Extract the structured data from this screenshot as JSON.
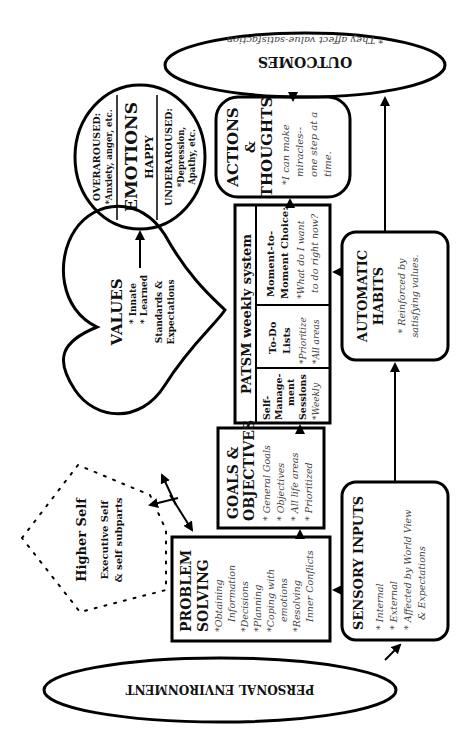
{
  "outcomes": {
    "title": "OUTCOMES",
    "note": "* They affect value-satisfaction"
  },
  "emotions": {
    "over_label": "OVERAROUSED:",
    "over_note": "*Anxiety, anger, etc.",
    "title": "EMOTIONS",
    "subtitle": "HAPPY",
    "under_label": "UNDERAROUSED:",
    "under_note1": "*Depression,",
    "under_note2": "Apathy, etc."
  },
  "actions": {
    "title1": "ACTIONS",
    "title2": "&",
    "title3": "THOUGHTS",
    "note1": "*I can make",
    "note2": "miracles--",
    "note3": "one step at a",
    "note4": "time."
  },
  "patsm": {
    "title": "PATSM weekly system",
    "col1": {
      "l1": "Self-",
      "l2": "Manage-",
      "l3": "ment",
      "l4": "Sessions",
      "l5": "*Weekly"
    },
    "col2": {
      "l1": "To-Do",
      "l2": "Lists",
      "l3": "*Prioritize",
      "l4": "*All areas"
    },
    "col3": {
      "l1": "Moment-to-",
      "l2": "Moment Choice:",
      "l3": "*What do I want",
      "l4": "to do right now?"
    }
  },
  "habits": {
    "title1": "AUTOMATIC",
    "title2": "HABITS",
    "note1": "* Reinforced by",
    "note2": "satisfying values."
  },
  "values": {
    "title": "VALUES",
    "item1": "* Innate",
    "item2": "* Learned",
    "sub1": "Standards &",
    "sub2": "Expectations"
  },
  "goals": {
    "title1": "GOALS &",
    "title2": "OBJECTIVES",
    "items": [
      "* General Goals",
      "* Objectives",
      "* All life areas",
      "* Prioritized"
    ]
  },
  "higher_self": {
    "title": "Higher Self",
    "sub1": "Executive Self",
    "sub2": "& self subparts"
  },
  "problem_solving": {
    "title1": "PROBLEM",
    "title2": "SOLVING",
    "items": [
      "*Obtaining",
      "Information",
      "*Decisions",
      "*Planning",
      "*Coping with",
      "emotions",
      "*Resolving",
      "Inner Conflicts"
    ]
  },
  "sensory": {
    "title": "SENSORY INPUTS",
    "items": [
      "* Internal",
      "* External",
      "* Affected by World View",
      "& Expectations"
    ]
  },
  "environment": {
    "title": "PERSONAL ENVIRONMENT"
  }
}
